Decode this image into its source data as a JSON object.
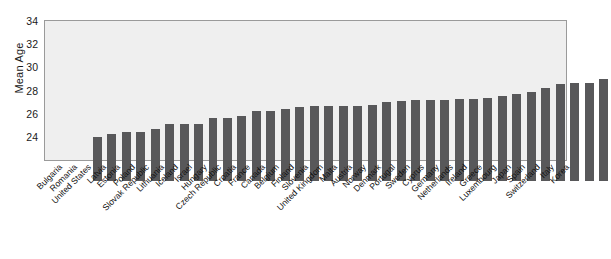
{
  "chart_data": {
    "type": "bar",
    "title": "",
    "xlabel": "",
    "ylabel": "Mean Age",
    "ylim": [
      22,
      34
    ],
    "yticks": [
      24,
      26,
      28,
      30,
      32,
      34
    ],
    "grid": false,
    "legend": null,
    "bar_color": "#58585a",
    "plot_background": "#efefef",
    "categories": [
      "Bulgaria",
      "Romania",
      "United States",
      "Latvia",
      "Estonia",
      "Poland",
      "Slovak Republic",
      "Lithuania",
      "Iceland",
      "Israel",
      "Hungary",
      "Czech Republic",
      "Croatia",
      "France",
      "Canada",
      "Belgium",
      "Finland",
      "Slovenia",
      "United Kingdom",
      "Malta",
      "Austria",
      "Norway",
      "Denmark",
      "Portugal",
      "Sweden",
      "Cyprus",
      "Germany",
      "Netherlands",
      "Ireland",
      "Greece",
      "Luxembourg",
      "Japan",
      "Spain",
      "Switzerland",
      "Italy",
      "Korea"
    ],
    "values": [
      25.8,
      26.1,
      26.25,
      26.25,
      26.5,
      26.9,
      26.95,
      26.95,
      27.45,
      27.45,
      27.6,
      28.05,
      28.05,
      28.2,
      28.4,
      28.5,
      28.5,
      28.5,
      28.5,
      28.55,
      28.85,
      28.9,
      29.0,
      29.0,
      29.0,
      29.05,
      29.1,
      29.15,
      29.35,
      29.5,
      29.65,
      30.05,
      30.4,
      30.45,
      30.5,
      30.85
    ]
  }
}
